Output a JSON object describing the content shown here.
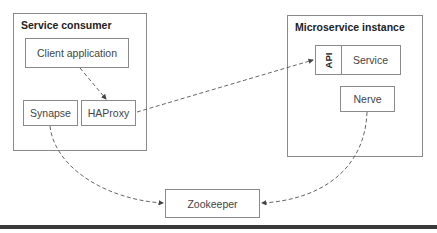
{
  "diagram": {
    "containers": {
      "consumer": {
        "title": "Service consumer"
      },
      "instance": {
        "title": "Microservice instance"
      }
    },
    "nodes": {
      "client_app": "Client application",
      "synapse": "Synapse",
      "haproxy": "HAProxy",
      "api": "API",
      "service": "Service",
      "nerve": "Nerve",
      "zookeeper": "Zookeeper"
    },
    "edges": [
      {
        "from": "Client application",
        "to": "HAProxy",
        "style": "dashed-arrow"
      },
      {
        "from": "HAProxy",
        "to": "API",
        "style": "dashed-arrow"
      },
      {
        "from": "Synapse",
        "to": "Zookeeper",
        "style": "dashed-curved-arrow"
      },
      {
        "from": "Nerve",
        "to": "Zookeeper",
        "style": "dashed-curved-arrow"
      }
    ],
    "colors": {
      "border": "#8a8a8a",
      "line": "#555555",
      "rule": "#3a3a3a"
    }
  }
}
